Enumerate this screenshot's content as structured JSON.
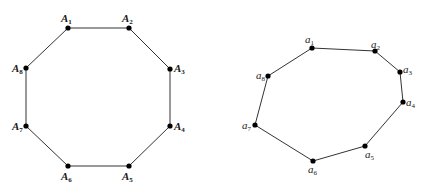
{
  "colors": {
    "line": "#333333",
    "point": "#000000",
    "label": "#1a1a1a",
    "background": "#ffffff"
  },
  "figures": [
    {
      "name": "regular-octagon",
      "prefix": "A",
      "vertices": [
        {
          "id": "A1",
          "label": "A",
          "sub": "1",
          "x": 68,
          "y": 28,
          "lx": 61,
          "ly": 22,
          "anchor": "start"
        },
        {
          "id": "A2",
          "label": "A",
          "sub": "2",
          "x": 129,
          "y": 28,
          "lx": 122,
          "ly": 22,
          "anchor": "start"
        },
        {
          "id": "A3",
          "label": "A",
          "sub": "3",
          "x": 170,
          "y": 69,
          "lx": 174,
          "ly": 72,
          "anchor": "start"
        },
        {
          "id": "A4",
          "label": "A",
          "sub": "4",
          "x": 170,
          "y": 126,
          "lx": 174,
          "ly": 130,
          "anchor": "start"
        },
        {
          "id": "A5",
          "label": "A",
          "sub": "5",
          "x": 129,
          "y": 166,
          "lx": 122,
          "ly": 180,
          "anchor": "start"
        },
        {
          "id": "A6",
          "label": "A",
          "sub": "6",
          "x": 68,
          "y": 166,
          "lx": 61,
          "ly": 180,
          "anchor": "start"
        },
        {
          "id": "A7",
          "label": "A",
          "sub": "7",
          "x": 26,
          "y": 126,
          "lx": 12,
          "ly": 130,
          "anchor": "start"
        },
        {
          "id": "A8",
          "label": "A",
          "sub": "8",
          "x": 26,
          "y": 68,
          "lx": 12,
          "ly": 72,
          "anchor": "start"
        }
      ]
    },
    {
      "name": "irregular-octagon",
      "prefix": "a",
      "vertices": [
        {
          "id": "a1",
          "label": "a",
          "sub": "1",
          "x": 312,
          "y": 48,
          "lx": 305,
          "ly": 43,
          "anchor": "start"
        },
        {
          "id": "a2",
          "label": "a",
          "sub": "2",
          "x": 375,
          "y": 51,
          "lx": 371,
          "ly": 48,
          "anchor": "start"
        },
        {
          "id": "a3",
          "label": "a",
          "sub": "3",
          "x": 400,
          "y": 72,
          "lx": 403,
          "ly": 73,
          "anchor": "start"
        },
        {
          "id": "a4",
          "label": "a",
          "sub": "4",
          "x": 403,
          "y": 102,
          "lx": 406,
          "ly": 106,
          "anchor": "start"
        },
        {
          "id": "a5",
          "label": "a",
          "sub": "5",
          "x": 365,
          "y": 146,
          "lx": 365,
          "ly": 158,
          "anchor": "start"
        },
        {
          "id": "a6",
          "label": "a",
          "sub": "6",
          "x": 313,
          "y": 161,
          "lx": 308,
          "ly": 173,
          "anchor": "start"
        },
        {
          "id": "a7",
          "label": "a",
          "sub": "7",
          "x": 255,
          "y": 125,
          "lx": 242,
          "ly": 129,
          "anchor": "start"
        },
        {
          "id": "a8",
          "label": "a",
          "sub": "8",
          "x": 268,
          "y": 76,
          "lx": 256,
          "ly": 79,
          "anchor": "start"
        }
      ]
    }
  ]
}
